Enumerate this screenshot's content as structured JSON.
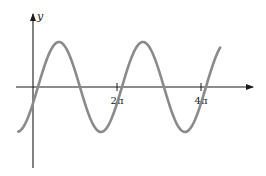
{
  "chart_data": {
    "type": "line",
    "title": "",
    "xlabel": "",
    "ylabel": "y",
    "x_ticks": [
      {
        "label": "2π",
        "value": 6.2832
      },
      {
        "label": "4π",
        "value": 12.5664
      }
    ],
    "function": "y = sin(x - 0.37)",
    "x_range": [
      -1.1,
      14.0
    ],
    "amplitude": 1,
    "period": "2π",
    "grid": false,
    "legend": null
  },
  "axes": {
    "y_label": "y",
    "tick_labels": [
      "2π",
      "4π"
    ]
  },
  "colors": {
    "curve": "#8a8a8a",
    "axis": "#1a1a1a"
  }
}
